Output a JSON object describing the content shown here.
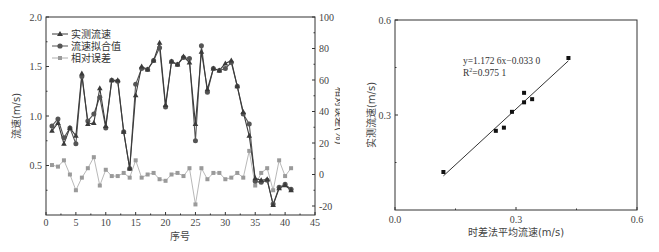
{
  "chart_data": [
    {
      "type": "line",
      "title": "",
      "xlabel": "序号",
      "ylabel": "流速(m/s)",
      "y2label": "相对误差(%)",
      "xlim": [
        0,
        45
      ],
      "ylim": [
        0,
        2.0
      ],
      "y2lim": [
        -25,
        100
      ],
      "x_ticks": [
        "0",
        "5",
        "10",
        "15",
        "20",
        "25",
        "30",
        "35",
        "40",
        "45"
      ],
      "y_ticks": [
        "0.5",
        "1.0",
        "1.5",
        "2.0"
      ],
      "y2_ticks": [
        "-20",
        "0",
        "20",
        "40",
        "60",
        "80",
        "100"
      ],
      "legend_position": "upper left",
      "grid": false,
      "x": [
        1,
        2,
        3,
        4,
        5,
        6,
        7,
        8,
        9,
        10,
        11,
        12,
        13,
        14,
        15,
        16,
        17,
        18,
        19,
        20,
        21,
        22,
        23,
        24,
        25,
        26,
        27,
        28,
        29,
        30,
        31,
        32,
        33,
        34,
        35,
        36,
        37,
        38,
        39,
        40,
        41
      ],
      "series": [
        {
          "name": "实测流速",
          "axis": "left",
          "marker": "triangle",
          "color": "#3a3a3a",
          "values": [
            0.85,
            0.93,
            0.72,
            0.88,
            0.8,
            1.43,
            0.92,
            0.93,
            1.28,
            0.9,
            1.36,
            1.36,
            0.84,
            0.47,
            1.21,
            1.5,
            1.47,
            1.56,
            1.74,
            1.11,
            1.55,
            1.52,
            1.6,
            1.54,
            0.92,
            1.65,
            1.27,
            1.48,
            1.46,
            1.53,
            1.56,
            1.3,
            1.04,
            0.8,
            0.37,
            0.35,
            0.36,
            0.1,
            0.27,
            0.3,
            0.25
          ]
        },
        {
          "name": "流速拟合值",
          "axis": "left",
          "marker": "circle",
          "color": "#555555",
          "values": [
            0.9,
            0.97,
            0.78,
            0.88,
            0.72,
            1.4,
            0.95,
            1.02,
            1.19,
            0.88,
            1.36,
            1.35,
            0.84,
            0.47,
            1.32,
            1.48,
            1.47,
            1.56,
            1.69,
            1.09,
            1.55,
            1.52,
            1.59,
            1.58,
            0.75,
            1.71,
            1.24,
            1.48,
            1.46,
            1.48,
            1.54,
            1.3,
            1.02,
            0.92,
            0.34,
            0.33,
            0.35,
            0.11,
            0.28,
            0.31,
            0.26
          ]
        },
        {
          "name": "相对误差",
          "axis": "right",
          "marker": "square",
          "color": "#9a9a9a",
          "values": [
            6,
            5,
            9,
            0,
            -10,
            -2,
            4,
            11,
            -7,
            3,
            -1,
            -1,
            1,
            -2,
            9,
            -2,
            0,
            1,
            -3,
            -4,
            0,
            1,
            -1,
            4,
            -19,
            4,
            -3,
            1,
            1,
            -3,
            -2,
            1,
            -2,
            15,
            -7,
            1,
            4,
            -10,
            9,
            -1,
            4
          ]
        }
      ]
    },
    {
      "type": "scatter",
      "title": "",
      "xlabel": "时差法平均流速(m/s)",
      "ylabel": "实测流速(m/s)",
      "xlim": [
        0.0,
        0.6
      ],
      "ylim": [
        0.0,
        0.6
      ],
      "x_ticks": [
        "0.0",
        "0.3",
        "0.6"
      ],
      "y_ticks": [
        "0.3",
        "0.6"
      ],
      "grid": false,
      "points": [
        {
          "x": 0.12,
          "y": 0.12
        },
        {
          "x": 0.25,
          "y": 0.25
        },
        {
          "x": 0.27,
          "y": 0.26
        },
        {
          "x": 0.29,
          "y": 0.31
        },
        {
          "x": 0.32,
          "y": 0.34
        },
        {
          "x": 0.32,
          "y": 0.37
        },
        {
          "x": 0.34,
          "y": 0.35
        },
        {
          "x": 0.43,
          "y": 0.48
        }
      ],
      "fit": {
        "slope": 1.1726,
        "intercept": -0.033,
        "x_range": [
          0.12,
          0.43
        ]
      },
      "annotations": [
        "y=1.172 6x−0.033 0",
        "R²=0.975 1"
      ]
    }
  ],
  "left_chart": {
    "ylabel": "流速(m/s)",
    "y2label": "相对误差(%)",
    "xlabel": "序号",
    "legend": [
      "实测流速",
      "流速拟合值",
      "相对误差"
    ]
  },
  "right_chart": {
    "xlabel": "时差法平均流速(m/s)",
    "ylabel": "实测流速(m/s)",
    "eq_line1": "y=1.172 6x−0.033 0",
    "eq_line2_prefix": "R",
    "eq_line2_sup": "2",
    "eq_line2_rest": "=0.975 1"
  }
}
